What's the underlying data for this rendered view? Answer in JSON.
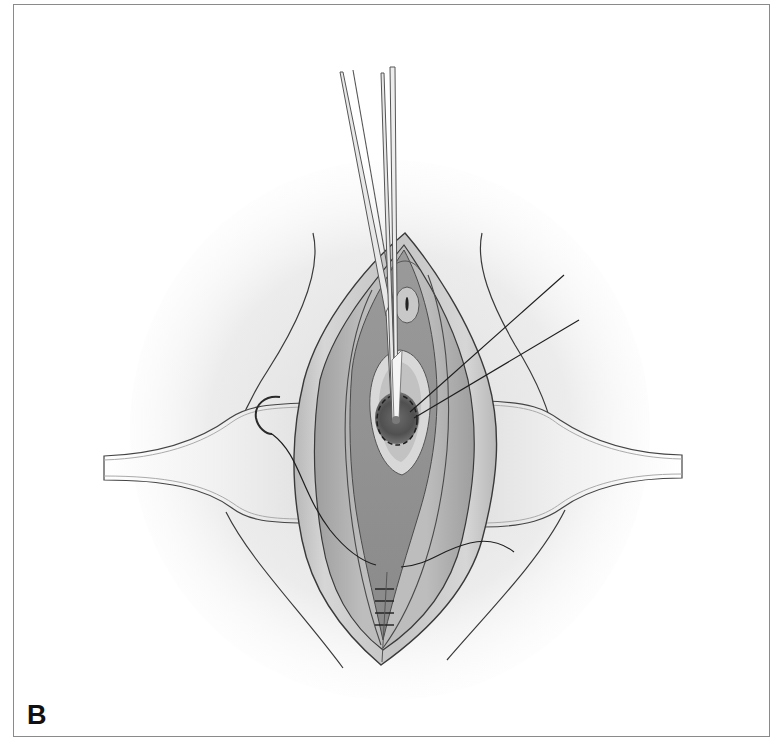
{
  "figure": {
    "panel_label": "B",
    "colors": {
      "border": "#8a8a8a",
      "ink": "#2b2b2b",
      "tissue_outer": "#cfcfcf",
      "tissue_mid": "#b4b4b4",
      "tissue_inner": "#9a9a9a",
      "vestibule": "#8c8c8c",
      "introitus_pale": "#dcdcdc",
      "lesion_dark": "#555555",
      "retractor_fill": "#f4f4f4",
      "background_halo": "#e6e6e6"
    },
    "elements": {
      "forceps_count": 2,
      "traction_sutures": 2,
      "interrupted_sutures": 4,
      "retractors": 2,
      "curved_needle": 1
    }
  }
}
